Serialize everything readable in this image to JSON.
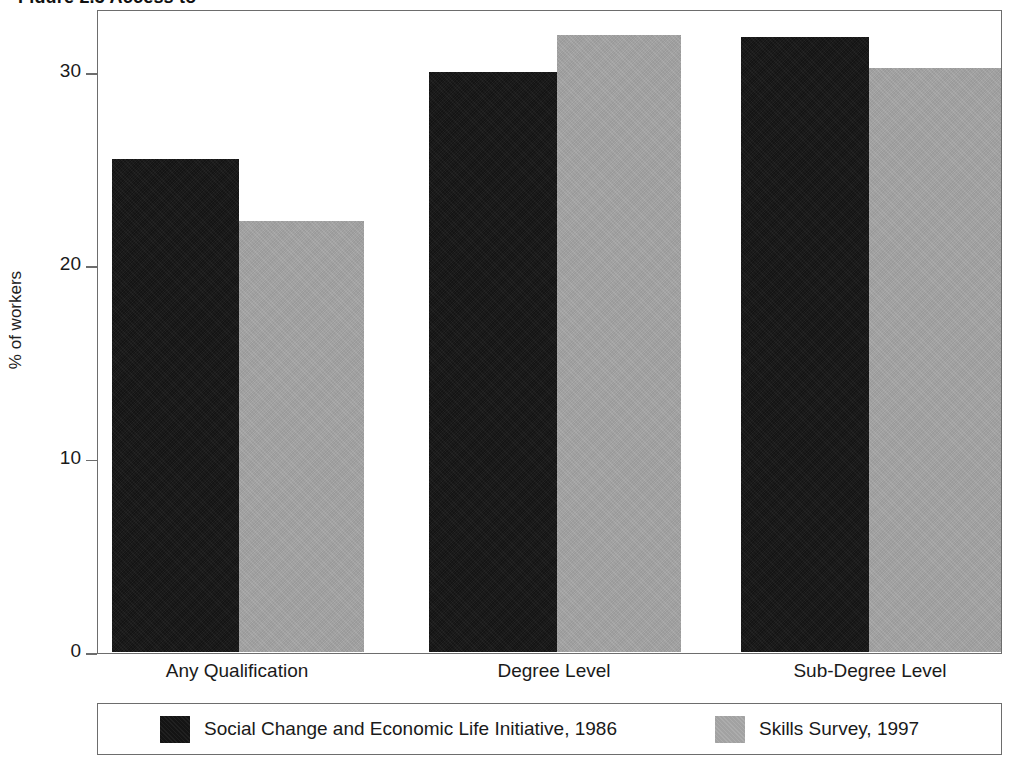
{
  "figure": {
    "title_fragment": "Figure 2.3  Access to",
    "background_color": "#ffffff"
  },
  "chart_data": {
    "type": "bar",
    "title": "",
    "xlabel": "",
    "ylabel": "% of workers",
    "categories": [
      "Any Qualification",
      "Degree Level",
      "Sub-Degree Level"
    ],
    "series": [
      {
        "name": "Social Change and Economic Life Initiative, 1986",
        "color": "#141414",
        "values": [
          25.5,
          30.0,
          31.8
        ]
      },
      {
        "name": "Skills Survey, 1997",
        "color": "#a2a2a2",
        "values": [
          22.3,
          31.9,
          30.2
        ]
      }
    ],
    "ylim": [
      0,
      33.8
    ],
    "yticks": [
      0,
      10,
      20,
      30
    ],
    "ytick_labels": [
      "0",
      "10",
      "20",
      "30"
    ],
    "grid": false,
    "legend_position": "bottom"
  },
  "legend": {
    "entries": [
      {
        "label": "Social Change and Economic Life Initiative, 1986",
        "swatch": "dark"
      },
      {
        "label": "Skills Survey, 1997",
        "swatch": "light"
      }
    ]
  }
}
